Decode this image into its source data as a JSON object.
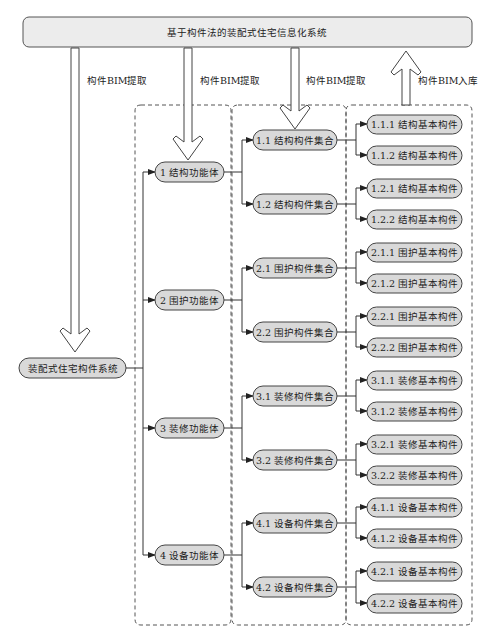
{
  "title": "基于构件法的装配式住宅信息化系统",
  "root": "装配式住宅构件系统",
  "arrows": [
    {
      "label": "构件BIM提取",
      "direction": "down"
    },
    {
      "label": "构件BIM提取",
      "direction": "down"
    },
    {
      "label": "构件BIM提取",
      "direction": "down"
    },
    {
      "label": "构件BIM入库",
      "direction": "up"
    }
  ],
  "level1": [
    {
      "label": "1 结构功能体"
    },
    {
      "label": "2 围护功能体"
    },
    {
      "label": "3 装修功能体"
    },
    {
      "label": "4 设备功能体"
    }
  ],
  "level2": [
    {
      "label": "1.1 结构构件集合"
    },
    {
      "label": "1.2 结构构件集合"
    },
    {
      "label": "2.1 围护构件集合"
    },
    {
      "label": "2.2 围护构件集合"
    },
    {
      "label": "3.1 装修构件集合"
    },
    {
      "label": "3.2 装修构件集合"
    },
    {
      "label": "4.1 设备构件集合"
    },
    {
      "label": "4.2 设备构件集合"
    }
  ],
  "level3": [
    {
      "label": "1.1.1 结构基本构件"
    },
    {
      "label": "1.1.2 结构基本构件"
    },
    {
      "label": "1.2.1 结构基本构件"
    },
    {
      "label": "1.2.2 结构基本构件"
    },
    {
      "label": "2.1.1 围护基本构件"
    },
    {
      "label": "2.1.2 围护基本构件"
    },
    {
      "label": "2.2.1 围护基本构件"
    },
    {
      "label": "2.2.2 围护基本构件"
    },
    {
      "label": "3.1.1 装修基本构件"
    },
    {
      "label": "3.1.2 装修基本构件"
    },
    {
      "label": "3.2.1 装修基本构件"
    },
    {
      "label": "3.2.2 装修基本构件"
    },
    {
      "label": "4.1.1 设备基本构件"
    },
    {
      "label": "4.1.2 设备基本构件"
    },
    {
      "label": "4.2.1 设备基本构件"
    },
    {
      "label": "4.2.2 设备基本构件"
    }
  ]
}
